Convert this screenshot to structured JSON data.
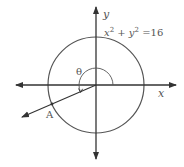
{
  "diagram": {
    "equation": {
      "x": "x",
      "exp1": "2",
      "plus": " + ",
      "y": "y",
      "exp2": "2",
      "rhs": " =16"
    },
    "axis_labels": {
      "x": "x",
      "y": "y"
    },
    "angle_label": "θ",
    "point_label": "A",
    "colors": {
      "stroke": "#333333",
      "circle": "#555555",
      "text": "#555555"
    }
  }
}
